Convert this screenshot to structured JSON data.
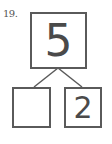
{
  "problem": {
    "number_label": "19."
  },
  "number_bond": {
    "whole": "5",
    "part_left": "",
    "part_right": "2"
  },
  "colors": {
    "stroke": "#5a5a5a",
    "text": "#4a4a4a",
    "label": "#555555",
    "background": "#ffffff"
  }
}
